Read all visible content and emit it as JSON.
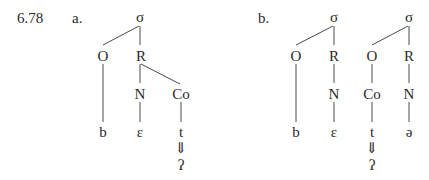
{
  "example_number": "6.78",
  "panels": [
    {
      "label": "a.",
      "nodes": {
        "sigma": "σ",
        "onset": "O",
        "rhyme": "R",
        "nucleus": "N",
        "coda": "Co",
        "onset_segment": "b",
        "nucleus_segment": "ɛ",
        "coda_segment": "t",
        "arrow": "⇓",
        "result": "ʔ"
      }
    },
    {
      "label": "b.",
      "syllables": [
        {
          "sigma": "σ",
          "onset": "O",
          "rhyme": "R",
          "nucleus": "N",
          "onset_segment": "b",
          "nucleus_segment": "ɛ"
        },
        {
          "sigma": "σ",
          "onset": "O",
          "rhyme": "R",
          "onset_coda": "Co",
          "nucleus": "N",
          "onset_segment": "t",
          "nucleus_segment": "ə",
          "arrow": "⇓",
          "result": "ʔ"
        }
      ]
    }
  ]
}
